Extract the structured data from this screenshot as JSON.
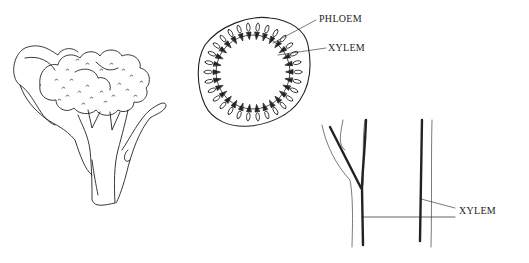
{
  "figure": {
    "panels": [
      {
        "name": "broccoli-illustration"
      },
      {
        "name": "stem-cross-section",
        "labels": [
          "PHLOEM",
          "XYLEM"
        ]
      },
      {
        "name": "stem-longitudinal-section",
        "labels": [
          "XYLEM"
        ]
      }
    ],
    "labels": {
      "phloem": "PHLOEM",
      "xylem_cross": "XYLEM",
      "xylem_long": "XYLEM"
    },
    "colors": {
      "ink": "#222222",
      "background": "#ffffff"
    }
  }
}
